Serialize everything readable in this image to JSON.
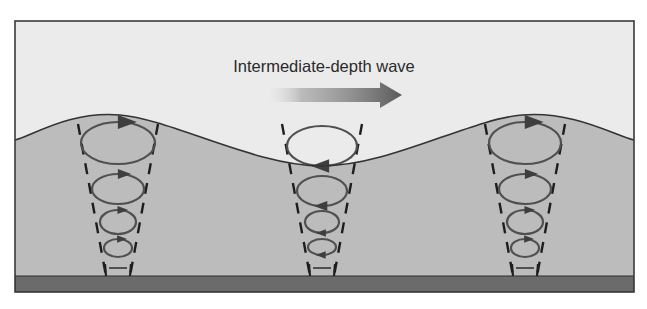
{
  "diagram": {
    "title": "Intermediate-depth wave",
    "frame": {
      "x": 15,
      "y": 21,
      "w": 619,
      "h": 271
    },
    "colors": {
      "sky": "#ebebeb",
      "water": "#bcbcbc",
      "seabed": "#6b6b6b",
      "frame": "#3a3a3a",
      "surface_line": "#333333",
      "orbit": "#505050",
      "dash": "#1e1e1e",
      "arrow_dark": "#5a5a5a",
      "arrow_light": "#d8d8d8",
      "title": "#2a2a2a"
    },
    "surface": {
      "points": [
        [
          15,
          140
        ],
        [
          120,
          115
        ],
        [
          322,
          166
        ],
        [
          522,
          115
        ],
        [
          634,
          140
        ]
      ]
    },
    "seabed": {
      "top": 276,
      "bottom": 292
    },
    "direction_arrow": {
      "label": "direction-of-wave-travel",
      "x1": 268,
      "x2": 402,
      "y": 95,
      "shaft_h": 14,
      "head_w": 22,
      "head_h": 26
    },
    "columns": [
      {
        "name": "crest-left",
        "cx": 118,
        "phase": "crest",
        "orbits": [
          {
            "cy": 143,
            "rx": 37,
            "ry": 21,
            "arrow": "top-right"
          },
          {
            "cy": 189,
            "rx": 26,
            "ry": 15,
            "arrow": "top-right"
          },
          {
            "cy": 222,
            "rx": 18,
            "ry": 12,
            "arrow": "top-right"
          },
          {
            "cy": 248,
            "rx": 14,
            "ry": 9,
            "arrow": "top-right"
          }
        ],
        "bottom_motion": {
          "y": 268,
          "half": 9
        }
      },
      {
        "name": "trough-middle",
        "cx": 322,
        "phase": "trough",
        "orbits": [
          {
            "cy": 146,
            "rx": 35,
            "ry": 20,
            "arrow": "bottom-left"
          },
          {
            "cy": 191,
            "rx": 25,
            "ry": 15,
            "arrow": "bottom-left"
          },
          {
            "cy": 222,
            "rx": 17,
            "ry": 11,
            "arrow": "bottom-left"
          },
          {
            "cy": 247,
            "rx": 14,
            "ry": 8,
            "arrow": "bottom-left"
          }
        ],
        "bottom_motion": {
          "y": 268,
          "half": 9
        }
      },
      {
        "name": "crest-right",
        "cx": 525,
        "phase": "crest",
        "orbits": [
          {
            "cy": 143,
            "rx": 36,
            "ry": 21,
            "arrow": "top-right"
          },
          {
            "cy": 189,
            "rx": 26,
            "ry": 15,
            "arrow": "top-right"
          },
          {
            "cy": 222,
            "rx": 18,
            "ry": 12,
            "arrow": "top-right"
          },
          {
            "cy": 248,
            "rx": 14,
            "ry": 9,
            "arrow": "top-right"
          }
        ],
        "bottom_motion": {
          "y": 268,
          "half": 9
        }
      }
    ],
    "guides": {
      "top_y": 124,
      "top_half": 40,
      "bottom_y": 276,
      "bottom_half": 12
    }
  }
}
